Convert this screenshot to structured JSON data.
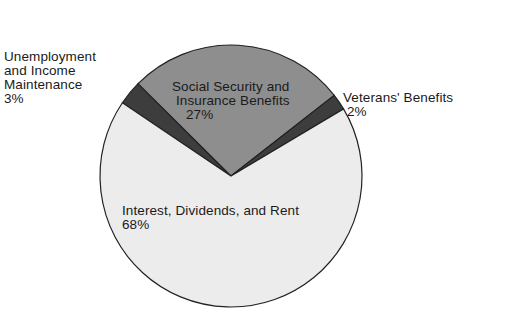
{
  "chart_data": {
    "type": "pie",
    "title": "",
    "slices": [
      {
        "label": "Unemployment and Income Maintenance",
        "value": 3,
        "color": "#3d3d3d"
      },
      {
        "label": "Social Security and Insurance Benefits",
        "value": 27,
        "color": "#8e8e8e"
      },
      {
        "label": "Veterans' Benefits",
        "value": 2,
        "color": "#3d3d3d"
      },
      {
        "label": "Interest, Dividends, and Rent",
        "value": 68,
        "color": "#ececec"
      }
    ],
    "start_angle_deg": -56,
    "center": [
      231,
      176
    ],
    "radius": 131,
    "legend": "none (direct labels)"
  },
  "labels": {
    "unemployment": {
      "line1": "Unemployment",
      "line2": "and Income",
      "line3": "Maintenance",
      "pct": "3%"
    },
    "social_security": {
      "line1": "Social Security and",
      "line2": "Insurance Benefits",
      "pct": "27%"
    },
    "veterans": {
      "line1": "Veterans' Benefits",
      "pct": "2%"
    },
    "interest": {
      "line1": "Interest, Dividends, and Rent",
      "pct": "68%"
    }
  }
}
